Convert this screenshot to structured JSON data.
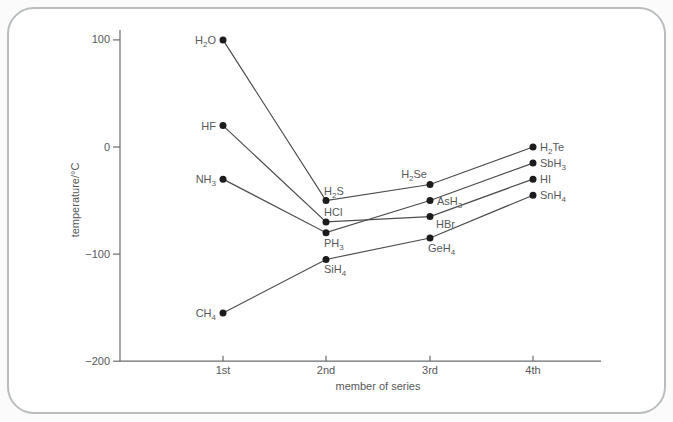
{
  "card": {
    "background": "#ffffff",
    "border_color": "#b9bdbf"
  },
  "colors": {
    "axis": "#6b6c6e",
    "text": "#57585a",
    "line": "#4c4d4f",
    "point": "#1c1c1c"
  },
  "chart_data": {
    "type": "line",
    "title": "",
    "xlabel": "member of series",
    "ylabel": "temperature/°C",
    "categories": [
      "1st",
      "2nd",
      "3rd",
      "4th"
    ],
    "yticks": [
      {
        "value": 100,
        "label": "100"
      },
      {
        "value": 0,
        "label": "0"
      },
      {
        "value": -100,
        "label": "−100"
      },
      {
        "value": -200,
        "label": "−200"
      }
    ],
    "ylim": [
      -200,
      110
    ],
    "grid": false,
    "legend": false,
    "series": [
      {
        "name": "group 14 hydrides (CH4 series)",
        "points": [
          {
            "label": "CH4",
            "formula": [
              "CH",
              {
                "sub": "4"
              }
            ],
            "x": "1st",
            "value": -155,
            "label_pos": "left"
          },
          {
            "label": "SiH4",
            "formula": [
              "SiH",
              {
                "sub": "4"
              }
            ],
            "x": "2nd",
            "value": -105,
            "label_pos": "below"
          },
          {
            "label": "GeH4",
            "formula": [
              "GeH",
              {
                "sub": "4"
              }
            ],
            "x": "3rd",
            "value": -85,
            "label_pos": "below"
          },
          {
            "label": "SnH4",
            "formula": [
              "SnH",
              {
                "sub": "4"
              }
            ],
            "x": "4th",
            "value": -45,
            "label_pos": "right"
          }
        ]
      },
      {
        "name": "group 15 hydrides (NH3 series)",
        "points": [
          {
            "label": "NH3",
            "formula": [
              "NH",
              {
                "sub": "3"
              }
            ],
            "x": "1st",
            "value": -30,
            "label_pos": "left"
          },
          {
            "label": "PH3",
            "formula": [
              "PH",
              {
                "sub": "3"
              }
            ],
            "x": "2nd",
            "value": -80,
            "label_pos": "below"
          },
          {
            "label": "AsH3",
            "formula": [
              "AsH",
              {
                "sub": "3"
              }
            ],
            "x": "3rd",
            "value": -50,
            "label_pos": "right"
          },
          {
            "label": "SbH3",
            "formula": [
              "SbH",
              {
                "sub": "3"
              }
            ],
            "x": "4th",
            "value": -15,
            "label_pos": "right"
          }
        ]
      },
      {
        "name": "group 16 hydrides (H2O series)",
        "points": [
          {
            "label": "H2O",
            "formula": [
              "H",
              {
                "sub": "2"
              },
              "O"
            ],
            "x": "1st",
            "value": 100,
            "label_pos": "left"
          },
          {
            "label": "H2S",
            "formula": [
              "H",
              {
                "sub": "2"
              },
              "S"
            ],
            "x": "2nd",
            "value": -50,
            "label_pos": "above"
          },
          {
            "label": "H2Se",
            "formula": [
              "H",
              {
                "sub": "2"
              },
              "Se"
            ],
            "x": "3rd",
            "value": -35,
            "label_pos": "above-left"
          },
          {
            "label": "H2Te",
            "formula": [
              "H",
              {
                "sub": "2"
              },
              "Te"
            ],
            "x": "4th",
            "value": 0,
            "label_pos": "right"
          }
        ]
      },
      {
        "name": "group 17 hydrides (HF series)",
        "points": [
          {
            "label": "HF",
            "formula": [
              "HF"
            ],
            "x": "1st",
            "value": 20,
            "label_pos": "left"
          },
          {
            "label": "HCl",
            "formula": [
              "HCl"
            ],
            "x": "2nd",
            "value": -70,
            "label_pos": "above"
          },
          {
            "label": "HBr",
            "formula": [
              "HBr"
            ],
            "x": "3rd",
            "value": -65,
            "label_pos": "below-right"
          },
          {
            "label": "HI",
            "formula": [
              "HI"
            ],
            "x": "4th",
            "value": -30,
            "label_pos": "right"
          }
        ]
      }
    ]
  }
}
